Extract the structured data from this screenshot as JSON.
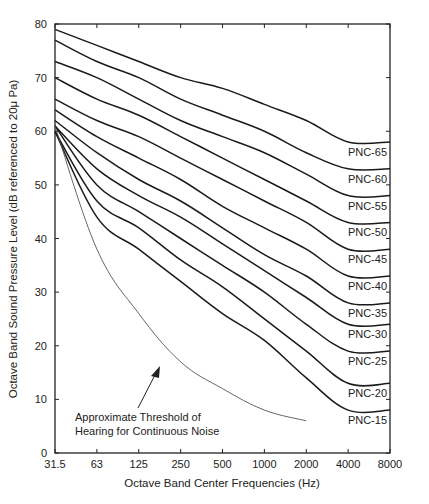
{
  "chart_data": {
    "type": "line",
    "title": "",
    "xlabel": "Octave Band Center Frequencies (Hz)",
    "ylabel": "Octave Band Sound Pressure Level (dB referenced to 20μ Pa)",
    "x": [
      "31.5",
      "63",
      "125",
      "250",
      "500",
      "1000",
      "2000",
      "4000",
      "8000"
    ],
    "x_scale": "log2 (octave)",
    "ylim": [
      0,
      80
    ],
    "yticks": [
      0,
      10,
      20,
      30,
      40,
      50,
      60,
      70,
      80
    ],
    "grid": false,
    "legend_position": "inline labels at right end of each curve",
    "series": [
      {
        "name": "PNC-65",
        "values": [
          79,
          76,
          73,
          70,
          68,
          65,
          62,
          58,
          58
        ]
      },
      {
        "name": "PNC-60",
        "values": [
          77,
          73,
          70,
          66,
          63,
          60,
          56,
          53,
          53
        ]
      },
      {
        "name": "PNC-55",
        "values": [
          73,
          70,
          66,
          62,
          59,
          56,
          52,
          48,
          48
        ]
      },
      {
        "name": "PNC-50",
        "values": [
          70,
          66,
          63,
          59,
          55,
          51,
          47,
          43,
          43
        ]
      },
      {
        "name": "PNC-45",
        "values": [
          66,
          62,
          59,
          55,
          51,
          47,
          43,
          38,
          38
        ]
      },
      {
        "name": "PNC-40",
        "values": [
          64,
          59,
          55,
          51,
          46,
          42,
          38,
          33,
          33
        ]
      },
      {
        "name": "PNC-35",
        "values": [
          62,
          56,
          51,
          47,
          42,
          37,
          33,
          28,
          28
        ]
      },
      {
        "name": "PNC-30",
        "values": [
          61,
          53,
          48,
          44,
          39,
          34,
          29,
          24,
          24
        ]
      },
      {
        "name": "PNC-25",
        "values": [
          61,
          50,
          45,
          40,
          35,
          30,
          24,
          19,
          19
        ]
      },
      {
        "name": "PNC-20",
        "values": [
          60,
          47,
          42,
          36,
          31,
          25,
          19,
          13,
          13
        ]
      },
      {
        "name": "PNC-15",
        "values": [
          60,
          44,
          38,
          32,
          26,
          21,
          14,
          8,
          8
        ]
      },
      {
        "name": "Approximate Threshold of Hearing for Continuous Noise",
        "style": "thin",
        "values": [
          61,
          38,
          26,
          17,
          12,
          8,
          6,
          null,
          null
        ]
      }
    ],
    "annotations": [
      {
        "text_lines": [
          "Approximate Threshold of",
          "Hearing for Continuous Noise"
        ],
        "arrow_to": "threshold curve near 250 Hz"
      }
    ]
  },
  "labels": {
    "xlabel": "Octave Band Center Frequencies (Hz)",
    "ylabel": "Octave Band Sound Pressure Level (dB referenced to 20μ Pa)",
    "annotation_line1": "Approximate Threshold of",
    "annotation_line2": "Hearing for Continuous Noise"
  },
  "style": {
    "curve_color": "#1a1a1a",
    "axis_color": "#222222",
    "threshold_color": "#555555"
  }
}
